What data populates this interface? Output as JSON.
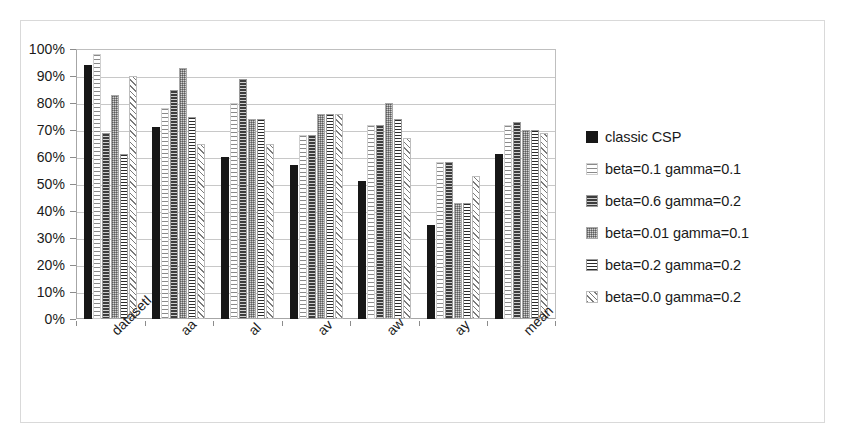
{
  "chart_data": {
    "type": "bar",
    "title": "",
    "xlabel": "",
    "ylabel": "",
    "ylim": [
      0,
      100
    ],
    "ytick_labels": [
      "100%",
      "90%",
      "80%",
      "70%",
      "60%",
      "50%",
      "40%",
      "30%",
      "20%",
      "10%",
      "0%"
    ],
    "ytick_values": [
      100,
      90,
      80,
      70,
      60,
      50,
      40,
      30,
      20,
      10,
      0
    ],
    "grid": true,
    "legend_position": "right",
    "categories": [
      "datasetI",
      "aa",
      "al",
      "av",
      "aw",
      "ay",
      "mean"
    ],
    "series": [
      {
        "name": "classic CSP",
        "values": [
          94,
          71,
          60,
          57,
          51,
          35,
          61
        ]
      },
      {
        "name": "beta=0.1 gamma=0.1",
        "values": [
          98,
          78,
          80,
          68,
          72,
          58,
          72
        ]
      },
      {
        "name": "beta=0.6 gamma=0.2",
        "values": [
          69,
          85,
          89,
          68,
          72,
          58,
          73
        ]
      },
      {
        "name": "beta=0.01 gamma=0.1",
        "values": [
          83,
          93,
          74,
          76,
          80,
          43,
          70
        ]
      },
      {
        "name": "beta=0.2 gamma=0.2",
        "values": [
          61,
          75,
          74,
          76,
          74,
          43,
          70
        ]
      },
      {
        "name": "beta=0.0 gamma=0.2",
        "values": [
          90,
          65,
          65,
          76,
          67,
          53,
          69
        ]
      }
    ],
    "series_patterns": [
      "solid-black",
      "sparse-horizontal-dash-light",
      "horizontal-lines-dark",
      "stipple-gray",
      "dense-horizontal-lines",
      "diagonal-hatch"
    ]
  },
  "legend": {
    "entries": [
      {
        "label": "classic CSP"
      },
      {
        "label": "beta=0.1 gamma=0.1"
      },
      {
        "label": "beta=0.6 gamma=0.2"
      },
      {
        "label": "beta=0.01 gamma=0.1"
      },
      {
        "label": "beta=0.2 gamma=0.2"
      },
      {
        "label": "beta=0.0 gamma=0.2"
      }
    ]
  },
  "colors": {
    "series0": "#171717",
    "frame": "#d9d9d9",
    "gridline": "#c8c8c8",
    "axis": "#a6a6a6",
    "text": "#1a1a1a",
    "background": "#ffffff"
  }
}
